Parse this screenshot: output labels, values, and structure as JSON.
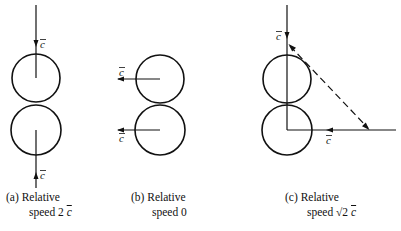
{
  "figure": {
    "panels": [
      {
        "id": "a",
        "velocity_label": "c",
        "caption_line1": "(a)  Relative",
        "caption_line2_prefix": "speed  2 ",
        "caption_line2_var": "c",
        "description": "Head-on collision: top molecule moving down, bottom molecule moving up"
      },
      {
        "id": "b",
        "velocity_label": "c",
        "caption_line1": "(b)  Relative",
        "caption_line2_prefix": "speed  0",
        "caption_line2_var": "",
        "description": "Both molecules moving left in parallel"
      },
      {
        "id": "c",
        "velocity_label": "c",
        "caption_line1": "(c)  Relative",
        "caption_line2_prefix": "speed  √2  ",
        "caption_line2_var": "c",
        "description": "Perpendicular approach: one moving down, one moving left; dashed line is relative velocity"
      }
    ],
    "colors": {
      "stroke": "#111111",
      "background": "#ffffff"
    }
  }
}
